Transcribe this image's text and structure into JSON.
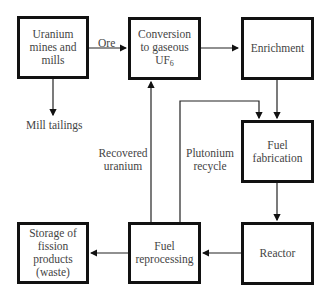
{
  "nodes": {
    "mines": {
      "label": "Uranium mines and mills"
    },
    "conversion": {
      "label": "Conversion to gaseous",
      "label2": "UF",
      "subscript": "6"
    },
    "enrichment": {
      "label": "Enrichment"
    },
    "fabrication": {
      "label": "Fuel fabrication"
    },
    "reactor": {
      "label": "Reactor"
    },
    "reprocessing": {
      "label": "Fuel reprocessing"
    },
    "storage": {
      "label": "Storage of fission products (waste)"
    }
  },
  "edges": {
    "ore": {
      "label": "Ore"
    },
    "tailings": {
      "label": "Mill tailings"
    },
    "recovered_uranium": {
      "label1": "Recovered",
      "label2": "uranium"
    },
    "plutonium_recycle": {
      "label1": "Plutonium",
      "label2": "recycle"
    }
  }
}
